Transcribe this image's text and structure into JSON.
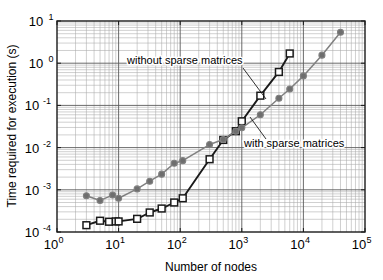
{
  "chart_data": {
    "type": "line",
    "title": "",
    "xlabel": "Number of nodes",
    "ylabel": "Time required for execution (s)",
    "xscale": "log",
    "yscale": "log",
    "xlim": [
      1,
      100000
    ],
    "ylim": [
      0.0001,
      10
    ],
    "grid": true,
    "minor_grid": true,
    "legend_position": "inline-annotations",
    "xticks": [
      "10^0",
      "10^1",
      "10^2",
      "10^3",
      "10^4",
      "10^5"
    ],
    "xtick_bases": [
      "10",
      "10",
      "10",
      "10",
      "10",
      "10"
    ],
    "xtick_exps": [
      "0",
      "1",
      "2",
      "3",
      "4",
      "5"
    ],
    "yticks": [
      "10^1",
      "10^0",
      "10^-1",
      "10^-2",
      "10^-3",
      "10^-4"
    ],
    "ytick_bases": [
      "10",
      "10",
      "10",
      "10",
      "10",
      "10"
    ],
    "ytick_exps": [
      "1",
      "0",
      "-1",
      "-2",
      "-3",
      "-4"
    ],
    "series": [
      {
        "name": "without sparse matrices",
        "marker": "square-open",
        "color": "#1a1a1a",
        "marker_fill": "#ffffff",
        "x": [
          3,
          5,
          7,
          9,
          10,
          20,
          32,
          50,
          80,
          110,
          300,
          500,
          800,
          1000,
          2000,
          4000,
          6000
        ],
        "y": [
          0.000145,
          0.000185,
          0.000175,
          0.000178,
          0.000178,
          0.000205,
          0.00029,
          0.00036,
          0.0005,
          0.00063,
          0.0053,
          0.0152,
          0.0245,
          0.042,
          0.17,
          0.62,
          1.7
        ]
      },
      {
        "name": "with sparse matrices",
        "marker": "circle-filled",
        "color": "#808080",
        "marker_fill": "#6e6e6e",
        "x": [
          3,
          5,
          8,
          10,
          20,
          32,
          50,
          80,
          110,
          300,
          500,
          800,
          1000,
          2000,
          4000,
          6000,
          10000,
          20000,
          40000
        ],
        "y": [
          0.00072,
          0.00056,
          0.00075,
          0.00063,
          0.00105,
          0.0016,
          0.00235,
          0.00425,
          0.0049,
          0.0118,
          0.0155,
          0.0245,
          0.0295,
          0.06,
          0.148,
          0.245,
          0.5,
          1.55,
          5.4
        ]
      }
    ],
    "annotations": [
      {
        "text": "without sparse matrices",
        "text_x": 127,
        "text_y": 64,
        "leader_from_x": 243,
        "leader_from_y": 68,
        "leader_to_x": 266,
        "leader_to_y": 99
      },
      {
        "text": "with sparse matrices",
        "text_x": 244,
        "text_y": 147,
        "leader_from_x": 266,
        "leader_from_y": 139,
        "leader_to_x": 250,
        "leader_to_y": 117
      }
    ],
    "colors": {
      "background": "#ffffff",
      "axis": "#1a1a1a",
      "major_grid": "#5a5a5a",
      "minor_grid": "#a8a8a8",
      "without_sparse": "#1a1a1a",
      "with_sparse": "#808080"
    }
  }
}
